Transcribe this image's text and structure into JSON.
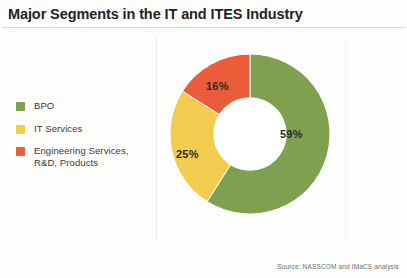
{
  "figure": {
    "title": "Major Segments in the IT and ITES Industry",
    "source_note": "Source: NASSCOM and IMaCS analysis",
    "background_color": "#fdfdfc"
  },
  "legend": {
    "items": [
      {
        "label": "BPO",
        "color": "#7fa04e"
      },
      {
        "label": "IT Services",
        "color": "#f2cc4f"
      },
      {
        "label": "Engineering Services, R&D, Products",
        "color": "#ea5c3a"
      }
    ]
  },
  "chart_data": {
    "type": "pie",
    "title": "Major Segments in the IT and ITES Industry",
    "subtitle": "",
    "xlabel": "",
    "ylabel": "",
    "donut": true,
    "inner_radius_ratio": 0.46,
    "start_angle_deg": 0,
    "direction": "clockwise",
    "legend_position": "left",
    "grid": false,
    "categories": [
      "BPO",
      "IT Services",
      "Engineering Services, R&D, Products"
    ],
    "values": [
      59,
      25,
      16
    ],
    "value_unit": "%",
    "data_labels": [
      "59%",
      "25%",
      "16%"
    ],
    "colors": [
      "#7fa04e",
      "#f2cc4f",
      "#ea5c3a"
    ],
    "annotations": [
      "Source: NASSCOM and IMaCS analysis"
    ]
  },
  "slice_labels": {
    "bpo": "59%",
    "it_services": "25%",
    "engineering": "16%"
  }
}
